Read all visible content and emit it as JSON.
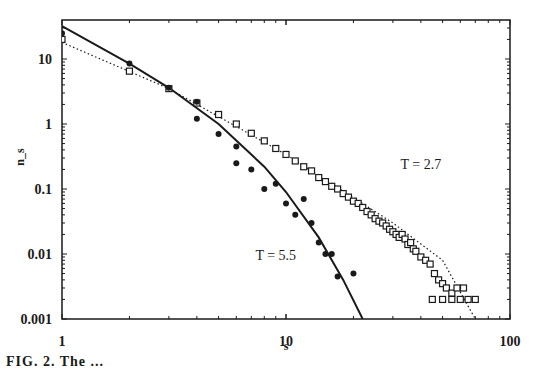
{
  "chart_data": {
    "type": "scatter",
    "title": "",
    "xlabel": "s",
    "ylabel": "n_s",
    "xscale": "log",
    "yscale": "log",
    "xlim": [
      1,
      100
    ],
    "ylim": [
      0.001,
      40
    ],
    "x_ticks": [
      1,
      10,
      100
    ],
    "x_tick_labels": [
      "1",
      "10",
      "100"
    ],
    "y_ticks": [
      10,
      1,
      0.1,
      0.01,
      0.001
    ],
    "y_tick_labels": [
      "10",
      "1",
      "0.1",
      "0.01",
      "0.001"
    ],
    "grid": false,
    "legend": null,
    "annotations": [
      {
        "text": "T = 2.7",
        "x": 40,
        "y": 0.2
      },
      {
        "text": "T = 5.5",
        "x": 9,
        "y": 0.008
      }
    ],
    "series": [
      {
        "name": "T = 2.7",
        "marker": "open-square",
        "x": [
          1,
          2,
          3,
          4,
          5,
          6,
          7,
          8,
          9,
          10,
          11,
          12,
          13,
          14,
          15,
          16,
          17,
          18,
          19,
          20,
          21,
          22,
          23,
          24,
          25,
          26,
          27,
          28,
          29,
          30,
          31,
          32,
          33,
          34,
          35,
          36,
          37,
          38,
          40,
          42,
          44,
          46,
          48,
          50,
          52,
          55,
          58,
          62,
          45,
          50,
          55,
          60,
          65,
          70
        ],
        "y": [
          20,
          6.5,
          3.5,
          2.1,
          1.4,
          1.0,
          0.72,
          0.55,
          0.42,
          0.34,
          0.27,
          0.22,
          0.19,
          0.15,
          0.13,
          0.11,
          0.1,
          0.085,
          0.075,
          0.065,
          0.06,
          0.052,
          0.045,
          0.04,
          0.035,
          0.032,
          0.03,
          0.027,
          0.024,
          0.022,
          0.02,
          0.018,
          0.02,
          0.017,
          0.014,
          0.015,
          0.012,
          0.011,
          0.009,
          0.008,
          0.007,
          0.005,
          0.004,
          0.0035,
          0.003,
          0.0025,
          0.003,
          0.003,
          0.002,
          0.002,
          0.002,
          0.002,
          0.002,
          0.002
        ]
      },
      {
        "name": "T = 5.5",
        "marker": "filled-circle",
        "x": [
          1,
          2,
          3,
          4,
          4,
          5,
          6,
          6,
          7,
          8,
          9,
          10,
          11,
          12,
          13,
          14,
          15,
          16,
          17,
          20
        ],
        "y": [
          25,
          8.5,
          3.6,
          2.2,
          1.2,
          0.7,
          0.45,
          0.25,
          0.2,
          0.1,
          0.12,
          0.06,
          0.04,
          0.07,
          0.03,
          0.015,
          0.01,
          0.01,
          0.0045,
          0.005
        ]
      },
      {
        "name": "T = 2.7 fit",
        "style": "dotted-line",
        "x": [
          1,
          3,
          10,
          30,
          50,
          70
        ],
        "y": [
          18,
          3.5,
          0.34,
          0.03,
          0.008,
          0.001
        ]
      },
      {
        "name": "T = 5.5 fit",
        "style": "solid-line",
        "x": [
          1,
          2,
          3,
          5,
          8,
          10,
          14,
          18,
          22
        ],
        "y": [
          32,
          8.5,
          3.6,
          1.0,
          0.22,
          0.09,
          0.018,
          0.004,
          0.001
        ]
      }
    ]
  },
  "caption": "FIG. 2.  The ..."
}
